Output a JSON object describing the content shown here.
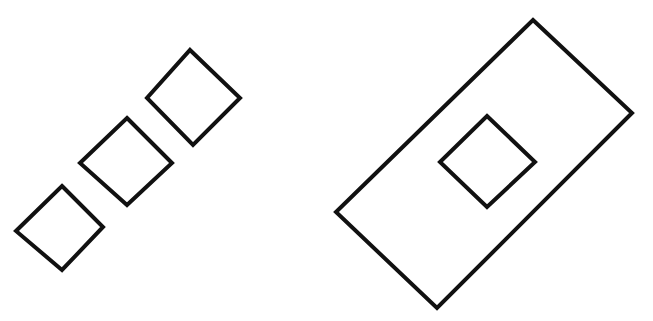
{
  "figure": {
    "canvas": {
      "width": 653,
      "height": 321
    },
    "background_color": "#ffffff",
    "stroke_color": "#111111",
    "stroke_width": 4,
    "fill": "none",
    "groups": [
      {
        "id": "left-group",
        "name": "chain-of-three-squares",
        "description": "Three equal rotated squares (diamonds) arranged along a diagonal from lower-left to upper-right, each touching the next at a vertex",
        "shapes": [
          {
            "id": "diamond-1",
            "name": "lower-left-square",
            "type": "rotated-square",
            "points": "62,186 103,227 62,270 16,231",
            "center": [
              60,
              228
            ],
            "side_length": 59,
            "rotation_deg": 45
          },
          {
            "id": "diamond-2",
            "name": "middle-square",
            "type": "rotated-square",
            "points": "127,118 172,163 127,205 80,163",
            "center": [
              126,
              161
            ],
            "side_length": 62,
            "rotation_deg": 45
          },
          {
            "id": "diamond-3",
            "name": "upper-right-square",
            "type": "rotated-square",
            "points": "190,50 240,98 193,145 147,98",
            "center": [
              192,
              97
            ],
            "side_length": 66,
            "rotation_deg": 45
          }
        ]
      },
      {
        "id": "right-group",
        "name": "rectangle-with-inner-square",
        "description": "A large rotated rectangle with a small rotated square centered inside it",
        "shapes": [
          {
            "id": "outer-rectangle",
            "name": "large-rotated-rectangle",
            "type": "rotated-rectangle",
            "points": "533,20 632,113 437,308 336,212",
            "center": [
              484,
              164
            ],
            "rotation_deg": 45
          },
          {
            "id": "inner-diamond",
            "name": "inner-small-square",
            "type": "rotated-square",
            "points": "487,116 535,162 487,207 440,162",
            "center": [
              487,
              162
            ],
            "side_length": 66,
            "rotation_deg": 45
          }
        ]
      }
    ]
  }
}
